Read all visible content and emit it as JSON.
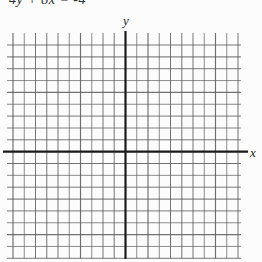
{
  "page": {
    "equation_label": "4y + 8x = -4"
  },
  "chart_data": {
    "type": "line",
    "title": "4y + 8x = -4",
    "xlabel": "x",
    "ylabel": "y",
    "series": [],
    "plotted_points": [],
    "axes": {
      "x_axis_visible": true,
      "y_axis_visible": true,
      "origin_centered": true,
      "tick_labels": []
    },
    "grid": {
      "visible": true,
      "columns": 20,
      "rows": 18,
      "cols_left_of_y_axis": 10,
      "cols_right_of_y_axis": 10,
      "rows_above_x_axis": 9,
      "rows_below_x_axis": 9
    }
  },
  "colors": {
    "background": "#fcfcfc",
    "grid_line": "#5a5a5a",
    "axis_line": "#1a1a1a",
    "text": "#2e2e2e"
  }
}
